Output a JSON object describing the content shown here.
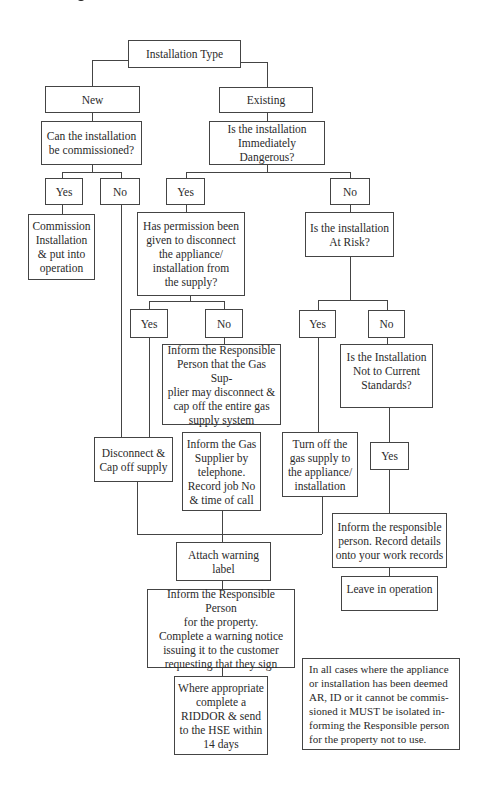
{
  "diagram": {
    "type": "flowchart",
    "nodes": {
      "root": "Installation Type",
      "new": "New",
      "existing": "Existing",
      "can_commission": "Can the installation\nbe commissioned?",
      "new_yes": "Yes",
      "new_no": "No",
      "commission": "Commission\nInstallation\n& put into\noperation",
      "immediately_dangerous": "Is the installation\nImmediately Dangerous?",
      "id_yes": "Yes",
      "id_no": "No",
      "permission": "Has permission been\ngiven to disconnect\nthe appliance/\ninstallation from\nthe supply?",
      "perm_yes": "Yes",
      "perm_no": "No",
      "inform_supplier_may_disconnect": "Inform the Responsible\nPerson that the Gas Sup-\nplier may disconnect &\ncap off the entire gas\nsupply system",
      "at_risk": "Is the installation\nAt Risk?",
      "ar_yes": "Yes",
      "ar_no": "No",
      "not_current_standards": "Is the Installation\nNot to Current\nStandards?",
      "ncs_yes": "Yes",
      "disconnect_cap": "Disconnect &\nCap off supply",
      "inform_gas_supplier": "Inform the Gas\nSupplier by\ntelephone.\nRecord job No\n& time of call",
      "turn_off": "Turn off the\ngas supply to\nthe appliance/\ninstallation",
      "inform_record": "Inform the responsible\nperson. Record details\nonto your work records",
      "leave_in_operation": "Leave in operation",
      "attach_label": "Attach warning\nlabel",
      "inform_warning_notice": "Inform the Responsible Person\nfor the property.\nComplete a warning notice\nissuing it to the customer\nrequesting that they sign",
      "riddor": "Where appropriate\ncomplete a\nRIDDOR & send\nto the HSE within\n14 days",
      "note": "In all cases where the appliance\nor installation has been deemed\nAR, ID or it cannot be commis-\nsioned it MUST be isolated in-\nforming the Responsible person\nfor the property not to use."
    }
  }
}
